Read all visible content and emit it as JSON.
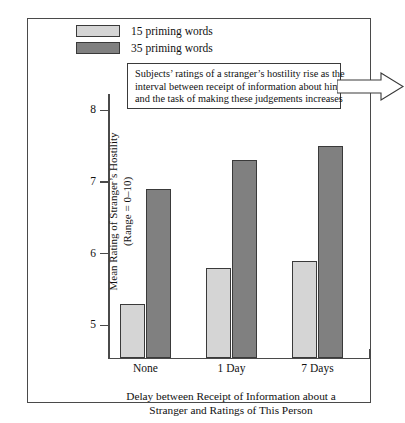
{
  "chart_data": {
    "type": "bar",
    "title": "",
    "categories": [
      "None",
      "1 Day",
      "7 Days"
    ],
    "series": [
      {
        "name": "15 priming words",
        "values": [
          5.3,
          5.8,
          5.9
        ],
        "color": "#d5d5d5"
      },
      {
        "name": "35 priming words",
        "values": [
          6.9,
          7.3,
          7.5
        ],
        "color": "#808080"
      }
    ],
    "xlabel_lines": [
      "Delay between Receipt of Information about a",
      "Stranger and Ratings of This Person"
    ],
    "ylabel_lines": [
      "Mean Rating of Stranger’s Hostility",
      "(Range = 0–10)"
    ],
    "yticks": [
      "8",
      "7",
      "6",
      "5"
    ],
    "ylim": [
      4.55,
      8.2
    ],
    "grid": false,
    "legend_position": "top-left",
    "annotation_lines": [
      "Subjects’ ratings of a stranger’s hostility rise as the",
      "interval between receipt of information about him",
      "and the task of making these judgements increases"
    ]
  }
}
